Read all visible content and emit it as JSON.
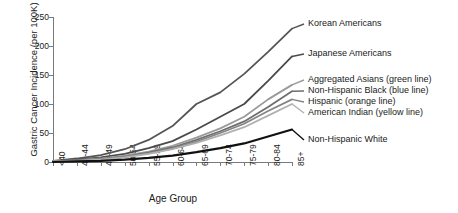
{
  "chart_data": {
    "type": "line",
    "title": "",
    "xlabel": "Age Group",
    "ylabel": "Gastric Cancer Incidence (per 100K)",
    "ylim": [
      0,
      250
    ],
    "yticks": [
      0,
      50,
      100,
      150,
      200,
      250
    ],
    "grid": false,
    "legend_position": "right-inline-end-of-line",
    "categories": [
      "<40",
      "40-44",
      "45-49",
      "50-54",
      "55-59",
      "60-64",
      "65-69",
      "70-74",
      "75-79",
      "80-84",
      "85+"
    ],
    "series": [
      {
        "name": "Korean Americans",
        "label": "Korean Americans",
        "color": "#555555",
        "values": [
          2,
          6,
          12,
          22,
          38,
          62,
          100,
          120,
          152,
          190,
          230
        ]
      },
      {
        "name": "Japanese Americans",
        "label": "Japanese Americans",
        "color": "#4a4a4a",
        "values": [
          1,
          4,
          8,
          14,
          24,
          36,
          56,
          78,
          100,
          140,
          182
        ]
      },
      {
        "name": "Aggregated Asians",
        "label": "Aggregated Asians (green line)",
        "color": "#9a9a9a",
        "values": [
          1,
          3,
          6,
          11,
          18,
          28,
          42,
          58,
          78,
          108,
          133
        ]
      },
      {
        "name": "Non-Hispanic Black",
        "label": "Non-Hispanic Black (blue line)",
        "color": "#6e6e6e",
        "values": [
          1,
          3,
          5,
          9,
          16,
          25,
          38,
          53,
          70,
          95,
          122
        ]
      },
      {
        "name": "Hispanic",
        "label": "Hispanic (orange line)",
        "color": "#858585",
        "values": [
          1,
          2,
          5,
          9,
          15,
          23,
          35,
          50,
          66,
          88,
          108
        ]
      },
      {
        "name": "American Indian",
        "label": "American Indian (yellow line)",
        "color": "#b0b0b0",
        "values": [
          1,
          2,
          4,
          8,
          14,
          22,
          33,
          46,
          60,
          80,
          100
        ]
      },
      {
        "name": "Non-Hispanic White",
        "label": "Non-Hispanic White",
        "color": "#111111",
        "values": [
          0,
          1,
          2,
          4,
          7,
          11,
          17,
          24,
          32,
          44,
          56
        ]
      }
    ]
  }
}
